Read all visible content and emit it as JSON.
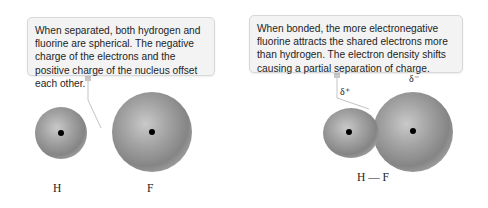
{
  "left_panel": {
    "callout": "When separated, both hydrogen and fluorine are spherical. The negative charge of the electrons and the positive charge of the nucleus offset each other.",
    "atoms": [
      {
        "symbol": "H",
        "label": "H"
      },
      {
        "symbol": "F",
        "label": "F"
      }
    ]
  },
  "right_panel": {
    "callout": "When bonded, the more electronegative fluorine attracts the shared electrons more than hydrogen. The electron density shifts causing a partial separation of charge.",
    "partial_positive": "δ⁺",
    "partial_negative": "δ⁻",
    "molecule_label": "H — F"
  },
  "colors": {
    "sphere": "#8f8f8f",
    "sphere_highlight": "#c4c4c4",
    "nucleus": "#000000",
    "callout_bg": "#f3f3f3",
    "connector": "#b5b5b5"
  }
}
